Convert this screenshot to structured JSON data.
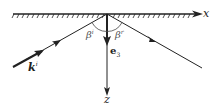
{
  "diagram": {
    "type": "reflection-geometry",
    "axes": {
      "x_label": "x",
      "z_label": "z"
    },
    "vectors": {
      "incident": "k",
      "incident_sup": "i",
      "normal": "e",
      "normal_sub": "3"
    },
    "angles": {
      "incident": "β",
      "incident_sup": "i",
      "reflected": "β",
      "reflected_sup": "r"
    },
    "colors": {
      "line": "#222222",
      "angle": "#555555"
    }
  }
}
